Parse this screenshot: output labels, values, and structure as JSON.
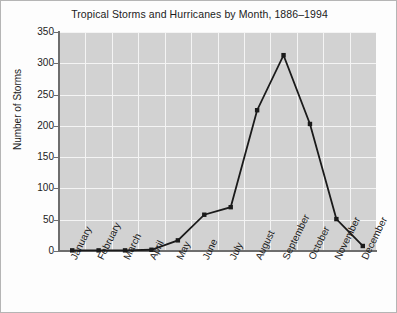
{
  "chart_data": {
    "type": "line",
    "title": "Tropical Storms and Hurricanes by Month, 1886–1994",
    "xlabel": "",
    "ylabel": "Number of Storms",
    "categories": [
      "January",
      "February",
      "March",
      "April",
      "May",
      "June",
      "July",
      "August",
      "September",
      "October",
      "November",
      "December"
    ],
    "values": [
      1,
      1,
      1,
      2,
      17,
      58,
      70,
      225,
      313,
      203,
      51,
      8
    ],
    "series": [
      {
        "name": "Tropical Storms and Hurricanes",
        "values": [
          1,
          1,
          1,
          2,
          17,
          58,
          70,
          225,
          313,
          203,
          51,
          8
        ]
      }
    ],
    "ylim": [
      0,
      350
    ],
    "yticks": [
      0,
      50,
      100,
      150,
      200,
      250,
      300,
      350
    ],
    "ytick_labels": [
      "0",
      "50",
      "100",
      "150",
      "200",
      "250",
      "300",
      "350"
    ],
    "grid": true,
    "legend": false,
    "marker": "square",
    "line_color": "#1a1a1a",
    "marker_color": "#1a1a1a",
    "plot_background": "#d2d2d2",
    "grid_color": "#f4f4f4",
    "figure_background": "#fdfdfd",
    "axis_color": "#6e6e6e"
  }
}
